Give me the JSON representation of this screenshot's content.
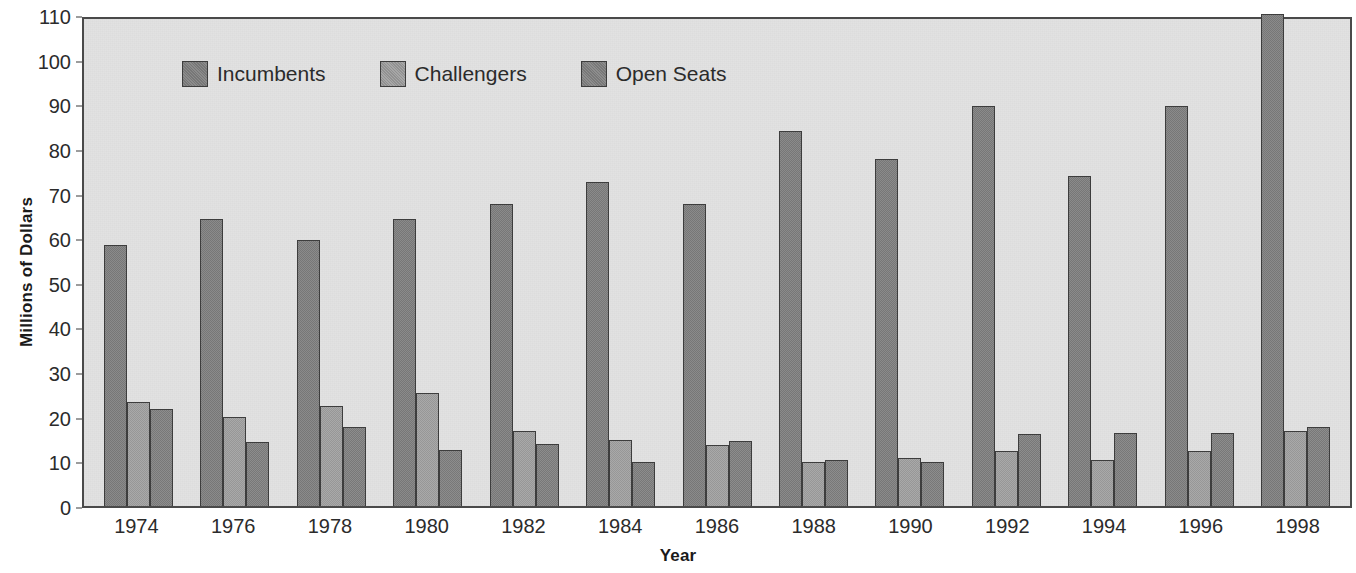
{
  "chart_data": {
    "type": "bar",
    "title": "",
    "subtitle": "",
    "xlabel": "Year",
    "ylabel": "Millions of Dollars",
    "ylim": [
      0,
      110
    ],
    "ytick_step": 10,
    "yticks": [
      110,
      100,
      90,
      80,
      70,
      60,
      50,
      40,
      30,
      20,
      10,
      0
    ],
    "grid": false,
    "legend_position": "top-left-inside",
    "categories": [
      "1974",
      "1976",
      "1978",
      "1980",
      "1982",
      "1984",
      "1986",
      "1988",
      "1990",
      "1992",
      "1994",
      "1996",
      "1998"
    ],
    "series": [
      {
        "name": "Incumbents",
        "color": "#848484",
        "values": [
          58.5,
          64.2,
          59.7,
          64.3,
          67.6,
          72.7,
          67.6,
          84.1,
          77.8,
          89.6,
          73.9,
          89.6,
          110.3
        ]
      },
      {
        "name": "Challengers",
        "color": "#a2a2a2",
        "values": [
          23.2,
          19.9,
          22.3,
          25.4,
          16.8,
          14.7,
          13.7,
          9.8,
          10.8,
          12.3,
          10.2,
          12.4,
          16.7
        ]
      },
      {
        "name": "Open Seats",
        "color": "#868686",
        "values": [
          21.8,
          14.3,
          17.7,
          12.6,
          14.0,
          9.9,
          14.5,
          10.2,
          9.9,
          16.2,
          16.3,
          16.4,
          17.6
        ]
      }
    ]
  },
  "legend": {
    "items": [
      {
        "label": "Incumbents",
        "color": "#848484"
      },
      {
        "label": "Challengers",
        "color": "#a2a2a2"
      },
      {
        "label": "Open Seats",
        "color": "#868686"
      }
    ]
  },
  "axes": {
    "y_axis_title": "Millions of Dollars",
    "x_axis_title": "Year"
  }
}
